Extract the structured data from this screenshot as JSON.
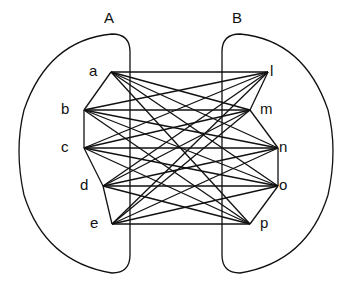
{
  "diagram": {
    "type": "complete-bipartite-graph",
    "regions": [
      {
        "id": "A",
        "label": "A",
        "label_pos": [
          104,
          10
        ]
      },
      {
        "id": "B",
        "label": "B",
        "label_pos": [
          232,
          10
        ]
      }
    ],
    "nodes": [
      {
        "id": "a",
        "label": "a",
        "x": 111,
        "y": 72,
        "set": "A",
        "label_pos": [
          89,
          63
        ]
      },
      {
        "id": "b",
        "label": "b",
        "x": 84,
        "y": 110,
        "set": "A",
        "label_pos": [
          61,
          101
        ]
      },
      {
        "id": "c",
        "label": "c",
        "x": 84,
        "y": 148,
        "set": "A",
        "label_pos": [
          61,
          139
        ]
      },
      {
        "id": "d",
        "label": "d",
        "x": 103,
        "y": 186,
        "set": "A",
        "label_pos": [
          80,
          177
        ]
      },
      {
        "id": "e",
        "label": "e",
        "x": 112,
        "y": 224,
        "set": "A",
        "label_pos": [
          90,
          215
        ]
      },
      {
        "id": "l",
        "label": "l",
        "x": 268,
        "y": 72,
        "set": "B",
        "label_pos": [
          270,
          63
        ]
      },
      {
        "id": "m",
        "label": "m",
        "x": 250,
        "y": 110,
        "set": "B",
        "label_pos": [
          260,
          101
        ]
      },
      {
        "id": "n",
        "label": "n",
        "x": 278,
        "y": 148,
        "set": "B",
        "label_pos": [
          279,
          139
        ]
      },
      {
        "id": "o",
        "label": "o",
        "x": 278,
        "y": 186,
        "set": "B",
        "label_pos": [
          279,
          177
        ]
      },
      {
        "id": "p",
        "label": "p",
        "x": 250,
        "y": 224,
        "set": "B",
        "label_pos": [
          260,
          215
        ]
      }
    ],
    "intra_edges": [
      [
        "a",
        "b"
      ],
      [
        "b",
        "c"
      ],
      [
        "c",
        "d"
      ],
      [
        "d",
        "e"
      ],
      [
        "l",
        "m"
      ],
      [
        "m",
        "n"
      ],
      [
        "n",
        "o"
      ],
      [
        "o",
        "p"
      ]
    ],
    "bipartite_edges": "all pairs between {a,b,c,d,e} and {l,m,n,o,p}",
    "stroke_color": "#111111"
  }
}
